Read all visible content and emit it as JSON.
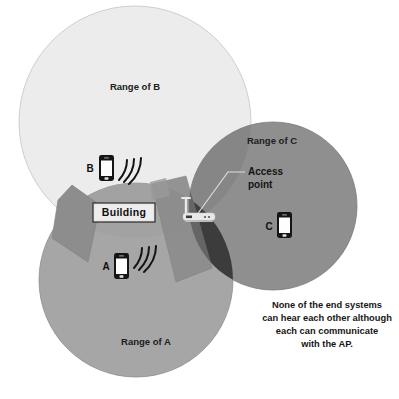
{
  "diagram": {
    "ranges": [
      {
        "id": "B",
        "label": "Range of B",
        "fill": "#ececec",
        "cx": 135,
        "cy": 122,
        "r": 116
      },
      {
        "id": "C",
        "label": "Range of C",
        "fill": "#8f8f8f",
        "cx": 273,
        "cy": 206,
        "r": 84
      },
      {
        "id": "A",
        "label": "Range of A",
        "fill": "#a6a6a6",
        "cx": 136,
        "cy": 280,
        "r": 97
      }
    ],
    "building": {
      "label": "Building",
      "fill": "#e6e6e6",
      "border": "#2a2a2a",
      "shadow_fill": "#8a8a8a"
    },
    "access_point": {
      "label_line1": "Access",
      "label_line2": "point",
      "icon": "wireless-router-icon",
      "body_fill": "#e8e8e8"
    },
    "devices": [
      {
        "id": "B",
        "label": "B",
        "icon": "smartphone-icon",
        "signal": "wifi-arcs-icon",
        "has_signal": true
      },
      {
        "id": "A",
        "label": "A",
        "icon": "smartphone-icon",
        "signal": "wifi-arcs-icon",
        "has_signal": true
      },
      {
        "id": "C",
        "label": "C",
        "icon": "smartphone-icon",
        "signal": "none",
        "has_signal": false
      }
    ],
    "caption": {
      "line1": "None of the end systems",
      "line2": "can hear each other although",
      "line3": "each can communicate",
      "line4": "with the AP."
    },
    "colors": {
      "background": "#ffffff",
      "range_b": "#ececec",
      "range_a": "#a6a6a6",
      "range_c": "#8f8f8f",
      "overlap_ac_dark": "#3c3c3c",
      "overlap_bc": "#7e7e7e",
      "outline": "#b9b9b9",
      "text": "#161616"
    }
  }
}
